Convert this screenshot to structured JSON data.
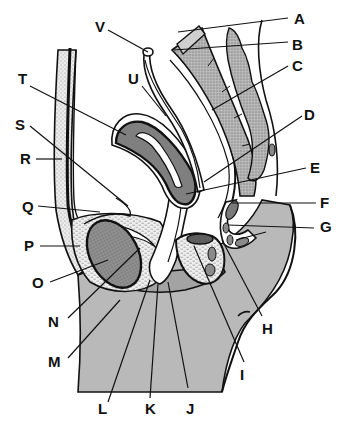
{
  "diagram": {
    "labels": [
      {
        "id": "A",
        "text": "A"
      },
      {
        "id": "B",
        "text": "B"
      },
      {
        "id": "C",
        "text": "C"
      },
      {
        "id": "D",
        "text": "D"
      },
      {
        "id": "E",
        "text": "E"
      },
      {
        "id": "F",
        "text": "F"
      },
      {
        "id": "G",
        "text": "G"
      },
      {
        "id": "H",
        "text": "H"
      },
      {
        "id": "I",
        "text": "I"
      },
      {
        "id": "J",
        "text": "J"
      },
      {
        "id": "K",
        "text": "K"
      },
      {
        "id": "L",
        "text": "L"
      },
      {
        "id": "M",
        "text": "M"
      },
      {
        "id": "N",
        "text": "N"
      },
      {
        "id": "O",
        "text": "O"
      },
      {
        "id": "P",
        "text": "P"
      },
      {
        "id": "Q",
        "text": "Q"
      },
      {
        "id": "R",
        "text": "R"
      },
      {
        "id": "S",
        "text": "S"
      },
      {
        "id": "T",
        "text": "T"
      },
      {
        "id": "U",
        "text": "U"
      },
      {
        "id": "V",
        "text": "V"
      }
    ],
    "colors": {
      "background": "#ffffff",
      "outline": "#111111",
      "soft_tissue_gray": "#b8b8b8",
      "organ_dark_gray": "#7a7a7a",
      "stipple_light": "#e4e4e4",
      "stipple_mid": "#a6a6a6",
      "bone_light": "#cfcfcf"
    }
  }
}
